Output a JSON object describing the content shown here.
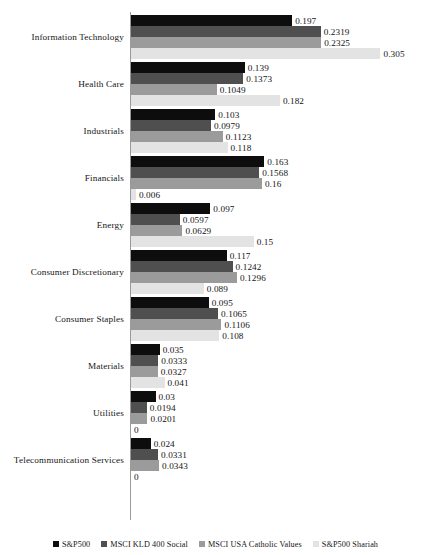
{
  "chart_data": {
    "type": "bar",
    "orientation": "horizontal",
    "title": "",
    "subtitle": "",
    "xlabel": "",
    "ylabel": "",
    "grid": false,
    "legend_position": "bottom",
    "xlim": [
      0,
      0.305
    ],
    "value_labels": true,
    "categories": [
      "Information Technology",
      "Health Care",
      "Industrials",
      "Financials",
      "Energy",
      "Consumer Discretionary",
      "Consumer Staples",
      "Materials",
      "Utilities",
      "Telecommunication Services"
    ],
    "series": [
      {
        "name": "S&P500",
        "color": "#0d0d0d",
        "values": [
          0.197,
          0.139,
          0.103,
          0.163,
          0.097,
          0.117,
          0.095,
          0.035,
          0.03,
          0.024
        ],
        "labels": [
          "0.197",
          "0.139",
          "0.103",
          "0.163",
          "0.097",
          "0.117",
          "0.095",
          "0.035",
          "0.03",
          "0.024"
        ]
      },
      {
        "name": "MSCI KLD 400 Social",
        "color": "#4f4f4f",
        "values": [
          0.2319,
          0.1373,
          0.0979,
          0.1568,
          0.0597,
          0.1242,
          0.1065,
          0.0333,
          0.0194,
          0.0331
        ],
        "labels": [
          "0.2319",
          "0.1373",
          "0.0979",
          "0.1568",
          "0.0597",
          "0.1242",
          "0.1065",
          "0.0333",
          "0.0194",
          "0.0331"
        ]
      },
      {
        "name": "MSCI USA Catholic Values",
        "color": "#9b9b9b",
        "values": [
          0.2325,
          0.1049,
          0.1123,
          0.16,
          0.0629,
          0.1296,
          0.1106,
          0.0327,
          0.0201,
          0.0343
        ],
        "labels": [
          "0.2325",
          "0.1049",
          "0.1123",
          "0.16",
          "0.0629",
          "0.1296",
          "0.1106",
          "0.0327",
          "0.0201",
          "0.0343"
        ]
      },
      {
        "name": "S&P500 Shariah",
        "color": "#e3e3e3",
        "values": [
          0.305,
          0.182,
          0.118,
          0.006,
          0.15,
          0.089,
          0.108,
          0.041,
          0,
          0
        ],
        "labels": [
          "0.305",
          "0.182",
          "0.118",
          "0.006",
          "0.15",
          "0.089",
          "0.108",
          "0.041",
          "0",
          "0"
        ]
      }
    ]
  },
  "legend": {
    "items": [
      {
        "label": "S&P500"
      },
      {
        "label": "MSCI KLD 400 Social"
      },
      {
        "label": "MSCI USA Catholic Values"
      },
      {
        "label": "S&P500 Shariah"
      }
    ]
  },
  "artifacts": {
    "smudge_a": "",
    "smudge_b": ""
  }
}
